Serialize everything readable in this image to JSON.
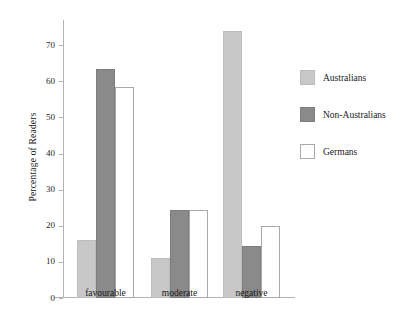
{
  "chart_data": {
    "type": "bar",
    "title": "",
    "xlabel": "",
    "ylabel": "Percentage of Readers",
    "categories": [
      "favourable",
      "moderate",
      "negative"
    ],
    "series": [
      {
        "name": "Australians",
        "color": "#c8c8c8",
        "values": [
          16,
          11,
          74
        ]
      },
      {
        "name": "Non-Australians",
        "color": "#8a8a8a",
        "values": [
          63.5,
          24.5,
          14.5
        ]
      },
      {
        "name": "Germans",
        "color": "#ffffff",
        "values": [
          58.5,
          24.5,
          20
        ]
      }
    ],
    "ylim": [
      0,
      77
    ],
    "yticks": [
      0,
      10,
      20,
      30,
      40,
      50,
      60,
      70
    ],
    "ytick_labels": [
      "0",
      "10",
      "20",
      "30",
      "40",
      "50",
      "60",
      "70"
    ],
    "grid": false,
    "legend_position": "right"
  }
}
